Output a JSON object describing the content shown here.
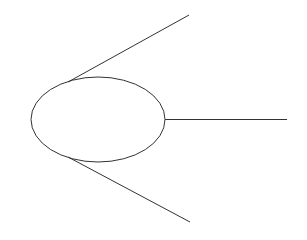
{
  "diagram": {
    "background": "#ffffff",
    "stroke": "#333333",
    "stroke_width": 1,
    "ellipse": {
      "cx": 98,
      "cy": 119.5,
      "rx": 67,
      "ry": 42.5
    },
    "lines": [
      {
        "name": "upper-line",
        "x1": 68,
        "y1": 82,
        "x2": 189,
        "y2": 15
      },
      {
        "name": "middle-line",
        "x1": 165,
        "y1": 119.5,
        "x2": 287,
        "y2": 119.5
      },
      {
        "name": "lower-line",
        "x1": 68,
        "y1": 157,
        "x2": 190,
        "y2": 222
      }
    ]
  }
}
